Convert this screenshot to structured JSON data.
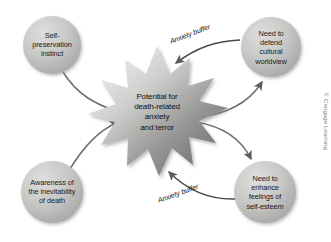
{
  "figure": {
    "type": "concept-diagram",
    "credit": "© Cengage Learning",
    "center": {
      "id": "potential-for-anxiety",
      "shape": "starburst",
      "lines": [
        "Potential for",
        "death-related",
        "anxiety",
        "and terror"
      ],
      "text": "Potential for death-related anxiety and terror"
    },
    "nodes": [
      {
        "id": "self-preservation-instinct",
        "position": "top-left",
        "lines": [
          "Self-",
          "preservation",
          "instinct"
        ],
        "text": "Self-preservation instinct"
      },
      {
        "id": "defend-cultural-worldview",
        "position": "top-right",
        "lines": [
          "Need to",
          "defend",
          "cultural",
          "worldview"
        ],
        "text": "Need to defend cultural worldview"
      },
      {
        "id": "awareness-inevitability-death",
        "position": "bottom-left",
        "lines": [
          "Awareness of",
          "the inevitability",
          "of death"
        ],
        "text": "Awareness of the inevitability of death"
      },
      {
        "id": "enhance-self-esteem",
        "position": "bottom-right",
        "lines": [
          "Need to",
          "enhance",
          "feelings of",
          "self-esteem"
        ],
        "text": "Need to enhance feelings of self-esteem"
      }
    ],
    "edge_labels": [
      {
        "id": "anxiety-buffer-top",
        "text": "Anxiety buffer"
      },
      {
        "id": "anxiety-buffer-bottom",
        "text": "Anxiety buffer"
      }
    ],
    "colors": {
      "circle_light": "#d8d8d6",
      "circle_mid": "#bdbdbb",
      "circle_dark": "#a3a3a1",
      "star_light": "#e8e8e6",
      "star_dark": "#6f6f6d",
      "arrow": "#5f5f5d",
      "background": "#ffffff",
      "text": "#141414",
      "credit_text": "#7d7d7d"
    }
  }
}
